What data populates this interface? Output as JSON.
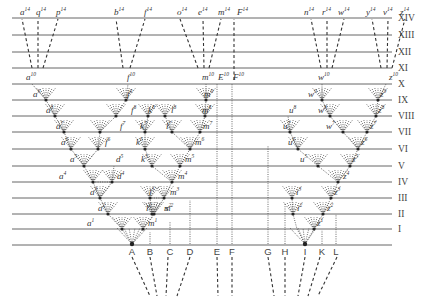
{
  "figure": {
    "generations": [
      "XIV",
      "XIII",
      "XII",
      "XI",
      "X",
      "IX",
      "VIII",
      "VII",
      "VI",
      "V",
      "IV",
      "III",
      "II",
      "I"
    ],
    "generation_y": [
      18,
      35,
      52,
      68,
      84,
      100,
      116,
      132,
      149,
      166,
      182,
      198,
      214,
      229
    ],
    "base_y": 245,
    "line_x_start": 12,
    "line_x_end": 392,
    "species": [
      {
        "label": "A",
        "x": 132
      },
      {
        "label": "B",
        "x": 150
      },
      {
        "label": "C",
        "x": 170
      },
      {
        "label": "D",
        "x": 190
      },
      {
        "label": "E",
        "x": 217
      },
      {
        "label": "F",
        "x": 232
      },
      {
        "label": "G",
        "x": 268
      },
      {
        "label": "H",
        "x": 285
      },
      {
        "label": "I",
        "x": 305
      },
      {
        "label": "K",
        "x": 322
      },
      {
        "label": "L",
        "x": 336
      }
    ],
    "top_labels": [
      {
        "t": "a",
        "s": "14",
        "x": 20,
        "y": 15
      },
      {
        "t": "q",
        "s": "14",
        "x": 36,
        "y": 15
      },
      {
        "t": "p",
        "s": "14",
        "x": 56,
        "y": 15
      },
      {
        "t": "b",
        "s": "14",
        "x": 114,
        "y": 15
      },
      {
        "t": "f",
        "s": "14",
        "x": 144,
        "y": 15
      },
      {
        "t": "o",
        "s": "14",
        "x": 177,
        "y": 15
      },
      {
        "t": "e",
        "s": "14",
        "x": 198,
        "y": 15
      },
      {
        "t": "m",
        "s": "14",
        "x": 218,
        "y": 15
      },
      {
        "t": "F",
        "s": "14",
        "x": 237,
        "y": 15
      },
      {
        "t": "n",
        "s": "14",
        "x": 304,
        "y": 15
      },
      {
        "t": "r",
        "s": "14",
        "x": 322,
        "y": 15
      },
      {
        "t": "w",
        "s": "14",
        "x": 338,
        "y": 15
      },
      {
        "t": "y",
        "s": "14",
        "x": 366,
        "y": 15
      },
      {
        "t": "v",
        "s": "14",
        "x": 383,
        "y": 15
      },
      {
        "t": "z",
        "s": "14",
        "x": 400,
        "y": 15
      }
    ],
    "gen10_labels": [
      {
        "t": "a",
        "s": "10",
        "x": 26,
        "y": 80
      },
      {
        "t": "f",
        "s": "10",
        "x": 127,
        "y": 80
      },
      {
        "t": "m",
        "s": "10",
        "x": 202,
        "y": 80
      },
      {
        "t": "E",
        "s": "10",
        "x": 218,
        "y": 80
      },
      {
        "t": "F",
        "s": "10",
        "x": 233,
        "y": 80
      },
      {
        "t": "w",
        "s": "10",
        "x": 318,
        "y": 80
      },
      {
        "t": "z",
        "s": "10",
        "x": 389,
        "y": 80
      }
    ],
    "branch_labels": [
      {
        "t": "a",
        "s": "9",
        "x": 33,
        "y": 97
      },
      {
        "t": "a",
        "s": "8",
        "x": 46,
        "y": 113
      },
      {
        "t": "a",
        "s": "7",
        "x": 56,
        "y": 129
      },
      {
        "t": "a",
        "s": "6",
        "x": 61,
        "y": 145
      },
      {
        "t": "a",
        "s": "5",
        "x": 70,
        "y": 162
      },
      {
        "t": "a",
        "s": "4",
        "x": 59,
        "y": 179
      },
      {
        "t": "d",
        "s": "5",
        "x": 116,
        "y": 162
      },
      {
        "t": "d",
        "s": "4",
        "x": 117,
        "y": 179
      },
      {
        "t": "a",
        "s": "3",
        "x": 90,
        "y": 195
      },
      {
        "t": "a",
        "s": "2",
        "x": 98,
        "y": 211
      },
      {
        "t": "a",
        "s": "1",
        "x": 87,
        "y": 226
      },
      {
        "t": "f",
        "s": "9",
        "x": 127,
        "y": 97
      },
      {
        "t": "f",
        "s": "8",
        "x": 131,
        "y": 113
      },
      {
        "t": "f",
        "s": "7",
        "x": 120,
        "y": 129
      },
      {
        "t": "f",
        "s": "6",
        "x": 105,
        "y": 145
      },
      {
        "t": "k",
        "s": "8",
        "x": 148,
        "y": 113
      },
      {
        "t": "k",
        "s": "7",
        "x": 140,
        "y": 129
      },
      {
        "t": "k",
        "s": "6",
        "x": 136,
        "y": 145
      },
      {
        "t": "k",
        "s": "5",
        "x": 141,
        "y": 162
      },
      {
        "t": "l",
        "s": "8",
        "x": 171,
        "y": 113
      },
      {
        "t": "l",
        "s": "7",
        "x": 166,
        "y": 129
      },
      {
        "t": "l",
        "s": "3",
        "x": 149,
        "y": 195
      },
      {
        "t": "l",
        "s": "2",
        "x": 146,
        "y": 211
      },
      {
        "t": "s",
        "s": "2",
        "x": 165,
        "y": 211
      },
      {
        "t": "m",
        "s": "9",
        "x": 204,
        "y": 97
      },
      {
        "t": "m",
        "s": "8",
        "x": 202,
        "y": 113
      },
      {
        "t": "m",
        "s": "7",
        "x": 203,
        "y": 129
      },
      {
        "t": "m",
        "s": "6",
        "x": 195,
        "y": 145
      },
      {
        "t": "m",
        "s": "5",
        "x": 185,
        "y": 162
      },
      {
        "t": "m",
        "s": "4",
        "x": 178,
        "y": 179
      },
      {
        "t": "m",
        "s": "3",
        "x": 170,
        "y": 195
      },
      {
        "t": "m",
        "s": "2",
        "x": 164,
        "y": 211
      },
      {
        "t": "m",
        "s": "1",
        "x": 148,
        "y": 226
      },
      {
        "t": "w",
        "s": "9",
        "x": 308,
        "y": 97
      },
      {
        "t": "w",
        "s": "8",
        "x": 318,
        "y": 113
      },
      {
        "t": "w",
        "s": "7",
        "x": 326,
        "y": 129
      },
      {
        "t": "u",
        "s": "8",
        "x": 289,
        "y": 113
      },
      {
        "t": "u",
        "s": "7",
        "x": 283,
        "y": 129
      },
      {
        "t": "u",
        "s": "6",
        "x": 288,
        "y": 145
      },
      {
        "t": "u",
        "s": "5",
        "x": 300,
        "y": 162
      },
      {
        "t": "z",
        "s": "9",
        "x": 380,
        "y": 97
      },
      {
        "t": "z",
        "s": "8",
        "x": 378,
        "y": 113
      },
      {
        "t": "z",
        "s": "7",
        "x": 370,
        "y": 129
      },
      {
        "t": "z",
        "s": "6",
        "x": 361,
        "y": 145
      },
      {
        "t": "z",
        "s": "5",
        "x": 352,
        "y": 162
      },
      {
        "t": "z",
        "s": "4",
        "x": 343,
        "y": 179
      },
      {
        "t": "z",
        "s": "3",
        "x": 334,
        "y": 195
      },
      {
        "t": "z",
        "s": "2",
        "x": 327,
        "y": 211
      },
      {
        "t": "z",
        "s": "1",
        "x": 317,
        "y": 226
      },
      {
        "t": "i",
        "s": "3",
        "x": 296,
        "y": 195
      },
      {
        "t": "i",
        "s": "2",
        "x": 297,
        "y": 211
      }
    ]
  }
}
